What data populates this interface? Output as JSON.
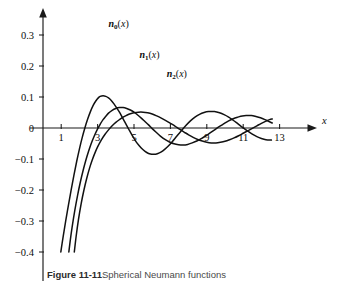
{
  "figure": {
    "caption_label": "Figure 11-11",
    "caption_rest": "Spherical Neumann functions",
    "background_color": "#ffffff",
    "curve_color": "#111111",
    "axis_color": "#1a1a1a"
  },
  "chart_data": {
    "type": "line",
    "title": "",
    "subtitle": "",
    "xlabel": "x",
    "ylabel": "",
    "xlim": [
      0,
      13.8
    ],
    "ylim": [
      -0.42,
      0.37
    ],
    "grid": false,
    "legend_position": "inline-annotations",
    "x_ticks": [
      1,
      3,
      5,
      7,
      9,
      11,
      13
    ],
    "x_tick_labels": [
      "1",
      "3",
      "5",
      "7",
      "9",
      "11",
      "13"
    ],
    "y_ticks": [
      0.3,
      0.2,
      0.1,
      0,
      -0.1,
      -0.2,
      -0.3,
      -0.4
    ],
    "y_tick_labels": [
      "0.3",
      "0.2",
      "0.1",
      "0",
      "−0.1",
      "−0.2",
      "−0.3",
      "−0.4"
    ],
    "annotations": [
      {
        "text": "n0(x)",
        "base": "n",
        "sub": "0",
        "arg": "(x)",
        "x": 3.6,
        "y": 0.325
      },
      {
        "text": "n1(x)",
        "base": "n",
        "sub": "1",
        "arg": "(x)",
        "x": 5.3,
        "y": 0.225
      },
      {
        "text": "n2(x)",
        "base": "n",
        "sub": "2",
        "arg": "(x)",
        "x": 6.8,
        "y": 0.165
      }
    ],
    "series": [
      {
        "name": "n0(x)",
        "order": 0,
        "x_start": 0.98,
        "x_end": 12.55,
        "points": [
          [
            0.98,
            -0.4
          ],
          [
            1.05,
            -0.372
          ],
          [
            1.15,
            -0.335
          ],
          [
            1.25,
            -0.299
          ],
          [
            1.4,
            -0.248
          ],
          [
            1.55,
            -0.199
          ],
          [
            1.7,
            -0.152
          ],
          [
            1.85,
            -0.108
          ],
          [
            2.0,
            -0.068
          ],
          [
            2.15,
            -0.032
          ],
          [
            2.3,
            0.0
          ],
          [
            2.45,
            0.028
          ],
          [
            2.6,
            0.052
          ],
          [
            2.75,
            0.072
          ],
          [
            2.9,
            0.087
          ],
          [
            3.05,
            0.098
          ],
          [
            3.14,
            0.102
          ],
          [
            3.3,
            0.104
          ],
          [
            3.45,
            0.102
          ],
          [
            3.6,
            0.097
          ],
          [
            3.75,
            0.089
          ],
          [
            3.9,
            0.078
          ],
          [
            4.05,
            0.065
          ],
          [
            4.2,
            0.051
          ],
          [
            4.35,
            0.035
          ],
          [
            4.5,
            0.019
          ],
          [
            4.71,
            -0.004
          ],
          [
            4.9,
            -0.024
          ],
          [
            5.1,
            -0.043
          ],
          [
            5.3,
            -0.058
          ],
          [
            5.5,
            -0.07
          ],
          [
            5.7,
            -0.079
          ],
          [
            5.9,
            -0.084
          ],
          [
            6.1,
            -0.085
          ],
          [
            6.28,
            -0.083
          ],
          [
            6.5,
            -0.077
          ],
          [
            6.7,
            -0.068
          ],
          [
            6.9,
            -0.057
          ],
          [
            7.1,
            -0.044
          ],
          [
            7.3,
            -0.03
          ],
          [
            7.5,
            -0.016
          ],
          [
            7.85,
            0.008
          ],
          [
            8.1,
            0.023
          ],
          [
            8.35,
            0.035
          ],
          [
            8.6,
            0.044
          ],
          [
            8.85,
            0.05
          ],
          [
            9.1,
            0.053
          ],
          [
            9.42,
            0.053
          ],
          [
            9.7,
            0.049
          ],
          [
            9.95,
            0.043
          ],
          [
            10.2,
            0.035
          ],
          [
            10.45,
            0.025
          ],
          [
            10.7,
            0.014
          ],
          [
            10.99,
            0.001
          ],
          [
            11.25,
            -0.01
          ],
          [
            11.5,
            -0.02
          ],
          [
            11.75,
            -0.028
          ],
          [
            12.0,
            -0.034
          ],
          [
            12.25,
            -0.038
          ],
          [
            12.55,
            -0.039
          ]
        ]
      },
      {
        "name": "n1(x)",
        "order": 1,
        "x_start": 1.42,
        "x_end": 12.6,
        "points": [
          [
            1.42,
            -0.4
          ],
          [
            1.5,
            -0.362
          ],
          [
            1.6,
            -0.32
          ],
          [
            1.75,
            -0.265
          ],
          [
            1.9,
            -0.217
          ],
          [
            2.05,
            -0.175
          ],
          [
            2.2,
            -0.138
          ],
          [
            2.35,
            -0.105
          ],
          [
            2.5,
            -0.076
          ],
          [
            2.65,
            -0.05
          ],
          [
            2.8,
            -0.028
          ],
          [
            3.0,
            -0.003
          ],
          [
            3.15,
            0.013
          ],
          [
            3.3,
            0.027
          ],
          [
            3.45,
            0.038
          ],
          [
            3.6,
            0.048
          ],
          [
            3.8,
            0.057
          ],
          [
            4.0,
            0.063
          ],
          [
            4.2,
            0.066
          ],
          [
            4.4,
            0.066
          ],
          [
            4.6,
            0.063
          ],
          [
            4.8,
            0.058
          ],
          [
            5.0,
            0.051
          ],
          [
            5.2,
            0.042
          ],
          [
            5.4,
            0.032
          ],
          [
            5.6,
            0.021
          ],
          [
            5.8,
            0.01
          ],
          [
            6.0,
            -0.002
          ],
          [
            6.2,
            -0.013
          ],
          [
            6.45,
            -0.026
          ],
          [
            6.7,
            -0.037
          ],
          [
            6.95,
            -0.045
          ],
          [
            7.2,
            -0.051
          ],
          [
            7.45,
            -0.054
          ],
          [
            7.7,
            -0.055
          ],
          [
            7.95,
            -0.053
          ],
          [
            8.2,
            -0.048
          ],
          [
            8.45,
            -0.042
          ],
          [
            8.7,
            -0.034
          ],
          [
            8.95,
            -0.025
          ],
          [
            9.2,
            -0.015
          ],
          [
            9.45,
            -0.005
          ],
          [
            9.7,
            0.005
          ],
          [
            9.95,
            0.014
          ],
          [
            10.2,
            0.023
          ],
          [
            10.45,
            0.03
          ],
          [
            10.7,
            0.035
          ],
          [
            10.95,
            0.039
          ],
          [
            11.2,
            0.04
          ],
          [
            11.45,
            0.04
          ],
          [
            11.7,
            0.037
          ],
          [
            11.95,
            0.033
          ],
          [
            12.2,
            0.027
          ],
          [
            12.45,
            0.02
          ],
          [
            12.6,
            0.016
          ]
        ]
      },
      {
        "name": "n2(x)",
        "order": 2,
        "x_start": 1.72,
        "x_end": 12.6,
        "points": [
          [
            1.72,
            -0.4
          ],
          [
            1.82,
            -0.35
          ],
          [
            1.95,
            -0.295
          ],
          [
            2.1,
            -0.243
          ],
          [
            2.25,
            -0.2
          ],
          [
            2.4,
            -0.163
          ],
          [
            2.55,
            -0.131
          ],
          [
            2.7,
            -0.104
          ],
          [
            2.85,
            -0.081
          ],
          [
            3.0,
            -0.061
          ],
          [
            3.2,
            -0.039
          ],
          [
            3.4,
            -0.021
          ],
          [
            3.6,
            -0.006
          ],
          [
            3.8,
            0.007
          ],
          [
            4.0,
            0.018
          ],
          [
            4.2,
            0.027
          ],
          [
            4.4,
            0.035
          ],
          [
            4.6,
            0.041
          ],
          [
            4.8,
            0.046
          ],
          [
            5.0,
            0.049
          ],
          [
            5.25,
            0.051
          ],
          [
            5.5,
            0.051
          ],
          [
            5.75,
            0.049
          ],
          [
            6.0,
            0.045
          ],
          [
            6.25,
            0.039
          ],
          [
            6.5,
            0.032
          ],
          [
            6.75,
            0.024
          ],
          [
            7.0,
            0.015
          ],
          [
            7.25,
            0.006
          ],
          [
            7.5,
            -0.004
          ],
          [
            7.75,
            -0.013
          ],
          [
            8.0,
            -0.022
          ],
          [
            8.25,
            -0.03
          ],
          [
            8.5,
            -0.037
          ],
          [
            8.75,
            -0.042
          ],
          [
            9.0,
            -0.046
          ],
          [
            9.25,
            -0.048
          ],
          [
            9.5,
            -0.048
          ],
          [
            9.75,
            -0.046
          ],
          [
            10.0,
            -0.043
          ],
          [
            10.25,
            -0.038
          ],
          [
            10.5,
            -0.032
          ],
          [
            10.75,
            -0.025
          ],
          [
            11.0,
            -0.017
          ],
          [
            11.25,
            -0.009
          ],
          [
            11.5,
            -0.001
          ],
          [
            11.75,
            0.007
          ],
          [
            12.0,
            0.015
          ],
          [
            12.25,
            0.022
          ],
          [
            12.45,
            0.027
          ],
          [
            12.6,
            0.029
          ]
        ]
      }
    ]
  }
}
